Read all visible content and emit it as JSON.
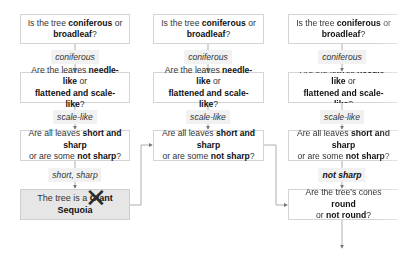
{
  "colors": {
    "box_border": "#d4d4d4",
    "result_fill": "#e6e6e6",
    "label_fill": "#f1f1f1",
    "line": "#9a9a9a",
    "text": "#333333"
  },
  "columns": [
    {
      "q1": {
        "pre": "Is the tree ",
        "b1": "coniferous",
        "mid": " or ",
        "b2": "broadleaf",
        "post": "?"
      },
      "a1": "coniferous",
      "q2": {
        "pre": "Are the leaves ",
        "b1": "needle-like",
        "mid": " or ",
        "b2": "flattened and scale-like",
        "post": "?"
      },
      "a2": "scale-like",
      "q3": {
        "pre": "Are all leaves ",
        "b1": "short and sharp",
        "mid": " or are some ",
        "b2": "not sharp",
        "post": "?"
      },
      "a3": "short, sharp",
      "result": {
        "pre": "The tree is a ",
        "b1": "Giant Sequoia",
        "status": "crossed-out",
        "mark_icon": "x-mark-icon"
      }
    },
    {
      "q1": {
        "pre": "Is the tree ",
        "b1": "coniferous",
        "mid": " or ",
        "b2": "broadleaf",
        "post": "?"
      },
      "a1": "coniferous",
      "q2": {
        "pre": "Are the leaves ",
        "b1": "needle-like",
        "mid": " or ",
        "b2": "flattened and scale-like",
        "post": "?"
      },
      "a2": "scale-like",
      "q3": {
        "pre": "Are all leaves ",
        "b1": "short and sharp",
        "mid": " or are some ",
        "b2": "not sharp",
        "post": "?"
      }
    },
    {
      "q1": {
        "pre": "Is the tree ",
        "b1": "coniferous",
        "mid": " or ",
        "b2": "broadleaf",
        "post": "?"
      },
      "a1": "coniferous",
      "q2": {
        "pre": "Are the leaves ",
        "b1": "needle-like",
        "mid": " or ",
        "b2": "flattened and scale-like",
        "post": "?"
      },
      "a2": "scale-like",
      "q3": {
        "pre": "Are all leaves ",
        "b1": "short and sharp",
        "mid": " or are some ",
        "b2": "not sharp",
        "post": "?"
      },
      "a3": "not sharp",
      "q4": {
        "pre": "Are the tree's cones ",
        "b1": "round",
        "mid": " or ",
        "b2": "not round",
        "post": "?"
      }
    }
  ]
}
